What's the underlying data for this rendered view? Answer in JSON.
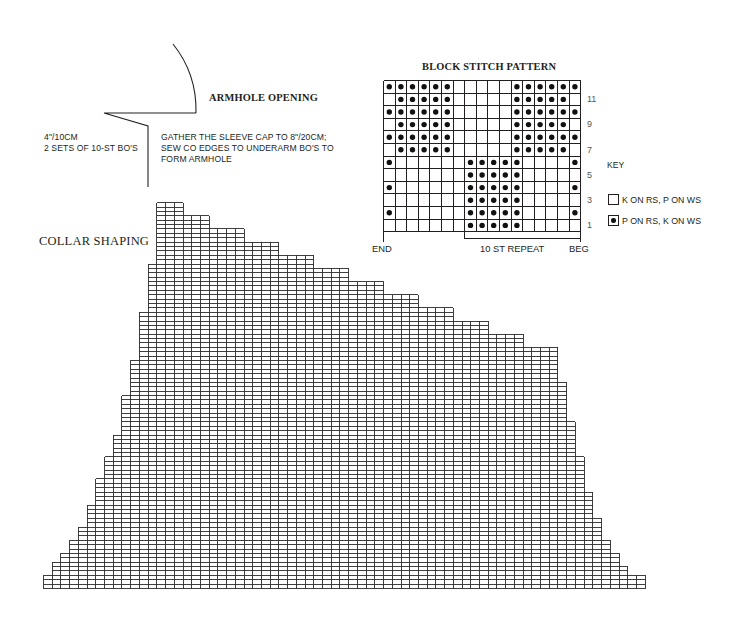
{
  "armhole": {
    "title": "ARMHOLE OPENING",
    "measure_lines": [
      "4\"/10CM",
      "2 SETS OF 10-ST BO'S"
    ],
    "note_lines": [
      "GATHER THE SLEEVE CAP TO 8\"/20CM;",
      "SEW CO EDGES TO UNDERARM BO'S TO",
      "FORM ARMHOLE"
    ]
  },
  "collar": {
    "label": "COLLAR SHAPING",
    "grid": {
      "description": "Stitch chart: each column listed with its number of rows (counted from cast-on edge); all columns start at row 0",
      "column_heights": [
        3,
        6,
        8,
        11,
        14,
        19,
        25,
        30,
        35,
        44,
        52,
        63,
        74,
        88,
        88,
        88,
        85,
        85,
        85,
        82,
        82,
        82,
        82,
        79,
        79,
        79,
        79,
        76,
        76,
        76,
        76,
        73,
        73,
        73,
        73,
        70,
        70,
        70,
        70,
        67,
        67,
        67,
        67,
        64,
        64,
        64,
        64,
        61,
        61,
        61,
        61,
        58,
        58,
        58,
        58,
        55,
        55,
        55,
        55,
        47,
        38,
        30,
        22,
        16,
        11,
        8,
        5,
        3,
        3
      ],
      "total_columns": 69,
      "total_rows": 88
    }
  },
  "block_stitch": {
    "title": "BLOCK STITCH PATTERN",
    "columns": 17,
    "rows_top_to_bottom": [
      "XXXXXX.....XXXXXX",
      ".XXXXX.....XXXXX.",
      "XXXXXX.....XXXXXX",
      ".XXXXX.....XXXXX.",
      "XXXXXX.....XXXXXX",
      ".XXXXX.....XXXXX.",
      "X......XXXXX....X",
      ".......XXXXX.....",
      "X......XXXXX....X",
      ".......XXXXX.....",
      "X......XXXXX....X",
      ".......XXXXX....."
    ],
    "row_numbers": [
      {
        "row": 11,
        "label": "11"
      },
      {
        "row": 9,
        "label": "9"
      },
      {
        "row": 7,
        "label": "7"
      },
      {
        "row": 5,
        "label": "5"
      },
      {
        "row": 3,
        "label": "3"
      },
      {
        "row": 1,
        "label": "1"
      }
    ],
    "end_label": "END",
    "repeat_label": "10 ST REPEAT",
    "beg_label": "BEG",
    "repeat_columns": [
      7,
      16
    ]
  },
  "key": {
    "title": "KEY",
    "items": [
      {
        "symbol": "empty",
        "label": "K ON RS, P ON WS"
      },
      {
        "symbol": "dot",
        "label": "P ON RS, K ON WS"
      }
    ]
  }
}
